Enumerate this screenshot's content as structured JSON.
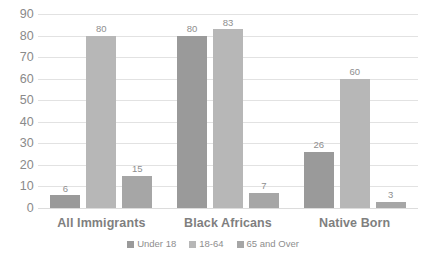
{
  "chart_data": {
    "type": "bar",
    "title": "",
    "subtitle": "",
    "xlabel": "",
    "ylabel": "",
    "categories": [
      "All Immigrants",
      "Black Africans",
      "Native Born"
    ],
    "series": [
      {
        "name": "Under 18",
        "color": "#9a9a9a",
        "values": [
          6,
          80,
          26
        ]
      },
      {
        "name": "18-64",
        "color": "#b7b7b7",
        "values": [
          80,
          83,
          60
        ]
      },
      {
        "name": "65 and Over",
        "color": "#a6a6a6",
        "values": [
          15,
          7,
          3
        ]
      }
    ],
    "ylim": [
      0,
      90
    ],
    "ytick_step": 10,
    "yticks": [
      "90",
      "80",
      "70",
      "60",
      "50",
      "40",
      "30",
      "20",
      "10",
      "0"
    ],
    "grid": true,
    "grid_axis": "y",
    "legend_position": "bottom",
    "data_labels": true,
    "colors": {
      "gridline": "#e2e2e2",
      "tick_text": "#8a8a8a",
      "category_text": "#7f7f7f",
      "label_text": "#8e8e8e",
      "background": "#ffffff"
    }
  }
}
